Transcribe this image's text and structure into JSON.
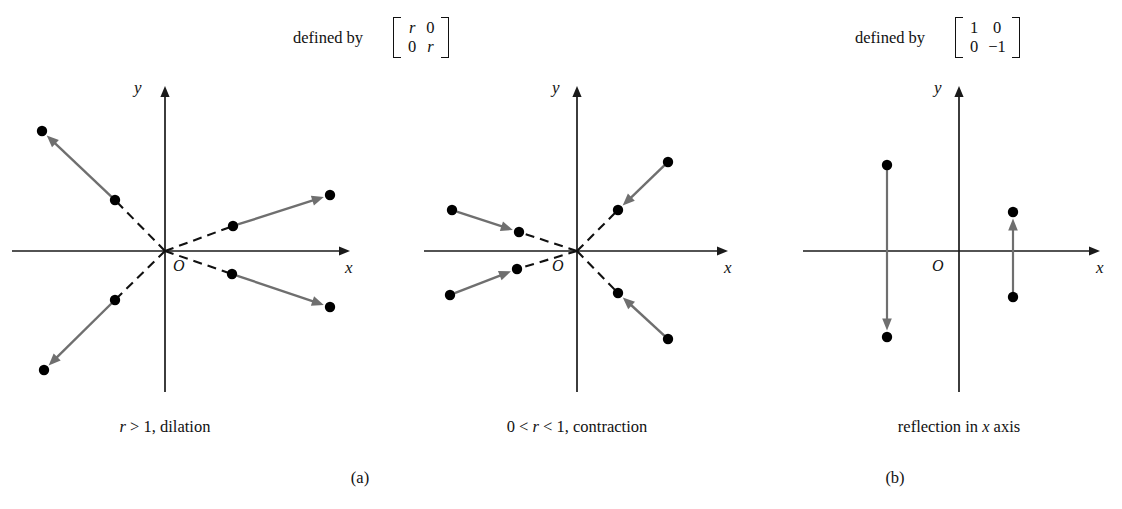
{
  "figure": {
    "panels": [
      {
        "id": "a",
        "label": "(a)",
        "label_x": 360,
        "label_y": 470,
        "defined_by_text": "defined by",
        "defined_by_x": 293,
        "defined_by_y": 30,
        "matrix": {
          "rows": [
            [
              "r",
              "0"
            ],
            [
              "0",
              "r"
            ]
          ],
          "x": 384,
          "y": 17
        },
        "plots": [
          {
            "id": "dilation",
            "caption": "r > 1, dilation",
            "caption_parts": {
              "pre": "r",
              "post": " > 1, dilation"
            },
            "caption_x": 165,
            "caption_y": 419,
            "origin": {
              "x": 165,
              "y": 251
            },
            "origin_label": "O",
            "origin_label_x": 173,
            "origin_label_y": 258,
            "x_axis": {
              "x1": 12,
              "x2": 350,
              "y": 251
            },
            "y_axis": {
              "y1": 86,
              "y2": 392,
              "x": 165
            },
            "x_label": "x",
            "x_label_x": 345,
            "x_label_y": 259,
            "y_label": "y",
            "y_label_x": 134,
            "y_label_y": 79,
            "arrow_direction": "outward",
            "rays": [
              {
                "name": "upper-left",
                "inner": {
                  "x": 115,
                  "y": 200
                },
                "outer": {
                  "x": 42,
                  "y": 131
                }
              },
              {
                "name": "upper-right",
                "inner": {
                  "x": 233,
                  "y": 226
                },
                "outer": {
                  "x": 330,
                  "y": 195
                }
              },
              {
                "name": "lower-right",
                "inner": {
                  "x": 232,
                  "y": 274
                },
                "outer": {
                  "x": 330,
                  "y": 307
                }
              },
              {
                "name": "lower-left",
                "inner": {
                  "x": 115,
                  "y": 300
                },
                "outer": {
                  "x": 44,
                  "y": 370
                }
              }
            ]
          },
          {
            "id": "contraction",
            "caption": "0 < r < 1, contraction",
            "caption_parts": {
              "pre": "0 < ",
              "mid": "r",
              "post": " < 1, contraction"
            },
            "caption_x": 577,
            "caption_y": 419,
            "origin": {
              "x": 577,
              "y": 251
            },
            "origin_label": "O",
            "origin_label_x": 552,
            "origin_label_y": 258,
            "x_axis": {
              "x1": 424,
              "x2": 728,
              "y": 251
            },
            "y_axis": {
              "y1": 86,
              "y2": 392,
              "x": 577
            },
            "x_label": "x",
            "x_label_x": 724,
            "x_label_y": 259,
            "y_label": "y",
            "y_label_x": 552,
            "y_label_y": 79,
            "arrow_direction": "inward",
            "rays": [
              {
                "name": "upper-left",
                "inner": {
                  "x": 519,
                  "y": 232
                },
                "outer": {
                  "x": 452,
                  "y": 210
                }
              },
              {
                "name": "upper-right",
                "inner": {
                  "x": 618,
                  "y": 210
                },
                "outer": {
                  "x": 668,
                  "y": 162
                }
              },
              {
                "name": "lower-right",
                "inner": {
                  "x": 618,
                  "y": 293
                },
                "outer": {
                  "x": 668,
                  "y": 339
                }
              },
              {
                "name": "lower-left",
                "inner": {
                  "x": 517,
                  "y": 269
                },
                "outer": {
                  "x": 450,
                  "y": 295
                }
              }
            ]
          }
        ]
      },
      {
        "id": "b",
        "label": "(b)",
        "label_x": 895,
        "label_y": 470,
        "defined_by_text": "defined by",
        "defined_by_x": 855,
        "defined_by_y": 30,
        "matrix": {
          "rows": [
            [
              "1",
              "0"
            ],
            [
              "0",
              "−1"
            ]
          ],
          "x": 946,
          "y": 17
        },
        "plots": [
          {
            "id": "reflection",
            "caption": "reflection in x axis",
            "caption_parts": {
              "pre": "reflection in ",
              "mid": "x",
              "post": " axis"
            },
            "caption_x": 959,
            "caption_y": 419,
            "origin": {
              "x": 959,
              "y": 251
            },
            "origin_label": "O",
            "origin_label_x": 932,
            "origin_label_y": 258,
            "x_axis": {
              "x1": 803,
              "x2": 1100,
              "y": 251
            },
            "y_axis": {
              "y1": 86,
              "y2": 392,
              "x": 959
            },
            "x_label": "x",
            "x_label_x": 1096,
            "x_label_y": 259,
            "y_label": "y",
            "y_label_x": 934,
            "y_label_y": 79,
            "arrow_direction": "segment",
            "segments": [
              {
                "name": "left-pair",
                "from": {
                  "x": 887,
                  "y": 165
                },
                "to": {
                  "x": 887,
                  "y": 337
                }
              },
              {
                "name": "right-pair",
                "from": {
                  "x": 1013,
                  "y": 297
                },
                "to": {
                  "x": 1013,
                  "y": 212
                }
              }
            ]
          }
        ]
      }
    ],
    "style": {
      "axis_color": "#1a1a1a",
      "dash_color": "#111111",
      "arrow_color": "#6f6f6f",
      "dot_color": "#000000",
      "background": "#ffffff"
    }
  }
}
